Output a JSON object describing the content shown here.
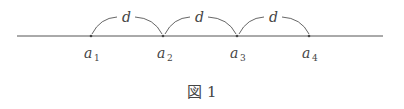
{
  "diagram": {
    "points": [
      {
        "name": "a",
        "sub": "1",
        "x": 91
      },
      {
        "name": "a",
        "sub": "2",
        "x": 163
      },
      {
        "name": "a",
        "sub": "3",
        "x": 237
      },
      {
        "name": "a",
        "sub": "4",
        "x": 309
      }
    ],
    "interval_label": "d",
    "line": {
      "x1": 17,
      "x2": 383,
      "y": 36
    },
    "caption": "図 1",
    "color": "#444444"
  }
}
